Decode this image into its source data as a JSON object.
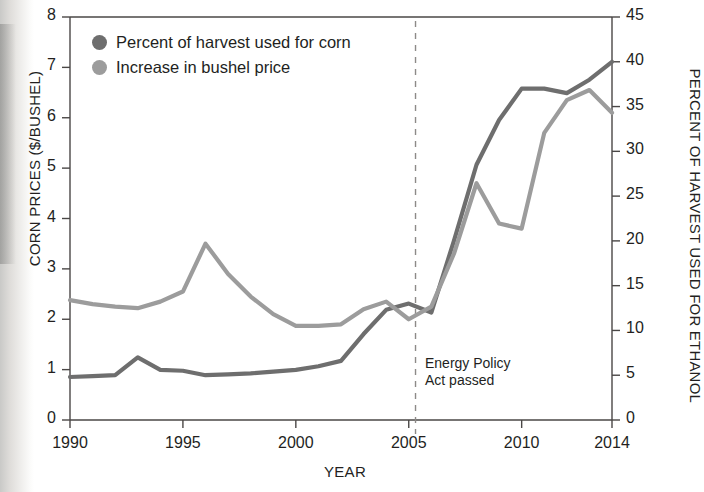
{
  "chart_data": {
    "type": "line",
    "title": "",
    "xlabel": "YEAR",
    "ylabel": "CORN PRICES ($/BUSHEL)",
    "y2label": "PERCENT OF HARVEST USED FOR ETHANOL",
    "xlim": [
      1990,
      2014
    ],
    "ylim": [
      0,
      8
    ],
    "y2lim": [
      0,
      45
    ],
    "xticks": [
      1990,
      1995,
      2000,
      2005,
      2010,
      2014
    ],
    "xticklabels": [
      "1990",
      "1995",
      "2000",
      "2005",
      "2010",
      "2014"
    ],
    "yticks": [
      0,
      1,
      2,
      3,
      4,
      5,
      6,
      7,
      8
    ],
    "yticklabels": [
      "0",
      "1",
      "2",
      "3",
      "4",
      "5",
      "6",
      "7",
      "8"
    ],
    "y2ticks": [
      0,
      5,
      10,
      15,
      20,
      25,
      30,
      35,
      40,
      45
    ],
    "y2ticklabels": [
      "0",
      "5",
      "10",
      "15",
      "20",
      "25",
      "30",
      "35",
      "40",
      "45"
    ],
    "grid": false,
    "legend_position": "top-left",
    "x": [
      1990,
      1991,
      1992,
      1993,
      1994,
      1995,
      1996,
      1997,
      1998,
      1999,
      2000,
      2001,
      2002,
      2003,
      2004,
      2005,
      2006,
      2007,
      2008,
      2009,
      2010,
      2011,
      2012,
      2013,
      2014
    ],
    "series": [
      {
        "name": "Percent of harvest used for corn",
        "axis": "right",
        "color": "#6e6e6e",
        "units": "percent of harvest used for ethanol",
        "values": [
          4.8,
          4.9,
          5.0,
          7.0,
          5.6,
          5.5,
          5.0,
          5.1,
          5.2,
          5.4,
          5.6,
          6.0,
          6.6,
          9.6,
          12.3,
          13.0,
          12.0,
          20.0,
          28.5,
          33.5,
          37.0,
          37.0,
          36.5,
          38.0,
          40.0
        ]
      },
      {
        "name": "Increase in bushel price",
        "axis": "left",
        "color": "#9c9c9c",
        "units": "dollars per bushel",
        "values": [
          2.38,
          2.3,
          2.25,
          2.22,
          2.35,
          2.55,
          3.5,
          2.9,
          2.45,
          2.1,
          1.87,
          1.87,
          1.9,
          2.2,
          2.35,
          2.0,
          2.25,
          3.3,
          4.7,
          3.9,
          3.8,
          5.7,
          6.35,
          6.55,
          6.1
        ]
      }
    ],
    "annotations": [
      {
        "name": "energy-policy-act",
        "text": "Energy Policy\nAct passed",
        "x": 2005.3,
        "marker": "dashed-vertical-line"
      }
    ]
  },
  "legend": {
    "items": [
      {
        "label": "Percent of harvest used for corn",
        "color": "#6e6e6e"
      },
      {
        "label": "Increase in bushel price",
        "color": "#9c9c9c"
      }
    ]
  }
}
